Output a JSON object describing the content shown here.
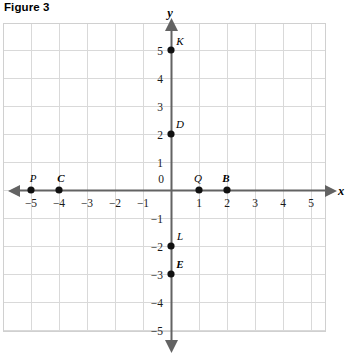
{
  "figure": {
    "title": "Figure 3"
  },
  "chart_data": {
    "type": "scatter",
    "title": "Figure 3",
    "xlabel": "x",
    "ylabel": "y",
    "xlim": [
      -6,
      5.5
    ],
    "ylim": [
      -5.6,
      5.5
    ],
    "grid": true,
    "grid_step": 1,
    "legend": "none",
    "x_ticks": [
      -5,
      -4,
      -3,
      -2,
      -1,
      1,
      2,
      3,
      4,
      5
    ],
    "x_tick_labels": [
      "−5",
      "−4",
      "−3",
      "−2",
      "−1",
      "1",
      "2",
      "3",
      "4",
      "5"
    ],
    "y_ticks": [
      5,
      4,
      3,
      2,
      1,
      -1,
      -2,
      -3,
      -4,
      -5
    ],
    "y_tick_labels": [
      "5",
      "4",
      "3",
      "2",
      "1",
      "−1",
      "−2",
      "−3",
      "−4",
      "−5"
    ],
    "origin_label": "0",
    "points": [
      {
        "label": "K",
        "x": 0,
        "y": 5,
        "bold": false,
        "label_dx": 9,
        "label_dy": -5
      },
      {
        "label": "D",
        "x": 0,
        "y": 2,
        "bold": false,
        "label_dx": 9,
        "label_dy": -6
      },
      {
        "label": "L",
        "x": 0,
        "y": -2,
        "bold": false,
        "label_dx": 9,
        "label_dy": -6
      },
      {
        "label": "E",
        "x": 0,
        "y": -3,
        "bold": true,
        "label_dx": 9,
        "label_dy": -6
      },
      {
        "label": "P",
        "x": -5,
        "y": 0,
        "bold": false,
        "label_dx": 2,
        "label_dy": -8
      },
      {
        "label": "C",
        "x": -4,
        "y": 0,
        "bold": true,
        "label_dx": 2,
        "label_dy": -8
      },
      {
        "label": "Q",
        "x": 1,
        "y": 0,
        "bold": false,
        "label_dx": -1,
        "label_dy": -8
      },
      {
        "label": "B",
        "x": 2,
        "y": 0,
        "bold": true,
        "label_dx": -1,
        "label_dy": -8
      }
    ]
  },
  "colors": {
    "grid_line": "#d9d9d9",
    "grid_border": "#d0d0d0",
    "axis": "#636363",
    "point": "#111111",
    "text": "#000000"
  }
}
